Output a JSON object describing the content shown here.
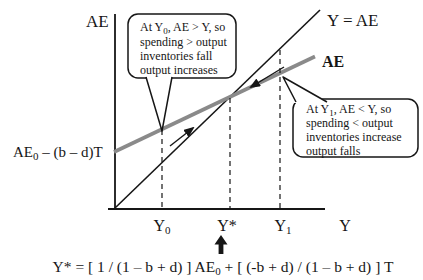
{
  "diagram": {
    "y_axis_title": "AE",
    "x_axis_title": "Y",
    "line45_label": "Y = AE",
    "ae_line_label": "AE",
    "intercept_label": {
      "base": "AE",
      "sub": "0",
      "rest": " – (b – d)T"
    },
    "x_ticks": {
      "y0": {
        "base": "Y",
        "sub": "0"
      },
      "ystar": "Y*",
      "y1": {
        "base": "Y",
        "sub": "1"
      }
    },
    "callout_y0": {
      "line1_a": "At Y",
      "line1_sub": "0",
      "line1_b": ", AE > Y, so",
      "line2": "spending > output",
      "line3": "inventories fall",
      "line4": "output increases"
    },
    "callout_y1": {
      "line1_a": "At Y",
      "line1_sub": "1",
      "line1_b": ", AE < Y, so",
      "line2": "spending < output",
      "line3": "inventories increase",
      "line4": "output falls"
    },
    "formula": {
      "p1": "Y* = [ 1 / (1 – b + d) ] AE",
      "sub": "0",
      "p2": " + [ (-b + d) / (1 – b + d) ] T"
    },
    "colors": {
      "ae_line": "#8a8a8a",
      "ink": "#161616",
      "background": "#ffffff"
    }
  }
}
